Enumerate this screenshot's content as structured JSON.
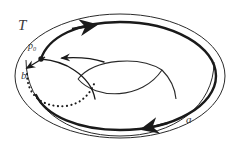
{
  "figure": {
    "kind": "torus-homology-diagram",
    "width": 244,
    "height": 161,
    "background_color": "#ffffff",
    "stroke_color": "#1a1a1a",
    "label_color": "#3a3a3a",
    "labels": {
      "surface": "T",
      "basepoint": "p",
      "basepoint_subscript": "0",
      "meridian_cycle": "b",
      "longitude_cycle": "a"
    },
    "curves": {
      "outer_outline": {
        "name": "torus-outer-outline",
        "style": "thin-solid",
        "stroke_width": 1.0
      },
      "inner_outline": {
        "name": "torus-inner-outline",
        "style": "thin-solid",
        "stroke_width": 1.0
      },
      "hole_top_arc": {
        "name": "torus-hole-top-arc",
        "style": "thin-solid",
        "stroke_width": 1.0
      },
      "hole_bottom_arc": {
        "name": "torus-hole-bottom-arc",
        "style": "thin-solid",
        "stroke_width": 1.0
      },
      "hole_tail_arc": {
        "name": "torus-hole-tail-arc",
        "style": "thin-solid",
        "stroke_width": 1.0
      },
      "cycle_a": {
        "name": "cycle-a",
        "style": "bold-solid",
        "stroke_width": 2.4,
        "orientation": "counterclockwise",
        "arrow_count": 2
      },
      "cycle_b_front": {
        "name": "cycle-b-front",
        "style": "medium-solid",
        "stroke_width": 1.3,
        "orientation": "toward-basepoint",
        "arrow_count": 2
      },
      "cycle_b_back": {
        "name": "cycle-b-back",
        "style": "dotted",
        "stroke_width": 2.0,
        "hidden_behind_surface": true
      }
    },
    "basepoint_dot": {
      "name": "basepoint-dot",
      "x": 41,
      "y": 59,
      "radius": 2.6
    }
  }
}
